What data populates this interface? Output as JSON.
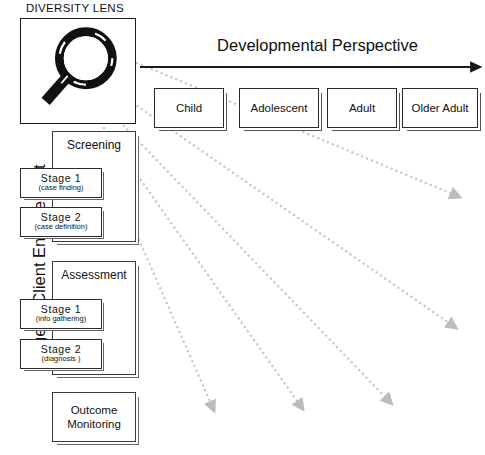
{
  "diagram": {
    "lens": {
      "label": "DIVERSITY LENS",
      "icon": "magnifying-glass-icon"
    },
    "horizontal_axis": {
      "label": "Developmental Perspective",
      "arrow_direction": "right",
      "stages": [
        {
          "label": "Child"
        },
        {
          "label": "Adolescent"
        },
        {
          "label": "Adult"
        },
        {
          "label": "Older Adult"
        }
      ]
    },
    "vertical_axis": {
      "label": "Stage of Client Engagement",
      "orientation": "bottom-to-top"
    },
    "engagement_groups": [
      {
        "label": "Screening",
        "stages": [
          {
            "main": "Stage  1",
            "sub": "(case finding)"
          },
          {
            "main": "Stage  2",
            "sub": "(case definition)"
          }
        ]
      },
      {
        "label": "Assessment",
        "stages": [
          {
            "main": "Stage  1",
            "sub": "(info gathering)"
          },
          {
            "main": "Stage  2",
            "sub": "(diagnosis )"
          }
        ]
      }
    ],
    "outcome": {
      "line1": "Outcome",
      "line2": "Monitoring"
    },
    "rays": {
      "count": 5,
      "style": "dotted-arrow",
      "color": "#bcbcbc",
      "origin": "diversity-lens"
    },
    "colors": {
      "ink": "#1a1a1a",
      "box_border": "#2b2b2b",
      "shadow": "#666666",
      "ray": "#bcbcbc",
      "background": "#ffffff"
    }
  }
}
